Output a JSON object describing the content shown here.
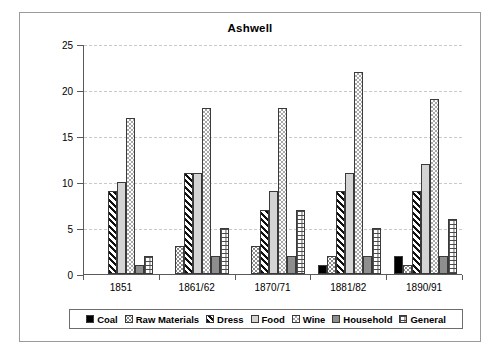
{
  "chart_data": {
    "type": "bar",
    "title": "Ashwell",
    "xlabel": "",
    "ylabel": "No. Principal Providers",
    "ylim": [
      0,
      25
    ],
    "ytick_values": [
      0,
      5,
      10,
      15,
      20,
      25
    ],
    "ytick_labels": [
      "0",
      "5",
      "10",
      "15",
      "20",
      "25"
    ],
    "grid": true,
    "legend_position": "bottom",
    "categories": [
      "1851",
      "1861/62",
      "1870/71",
      "1881/82",
      "1890/91"
    ],
    "series": [
      {
        "name": "Coal",
        "pattern": "solid-black",
        "values": [
          0,
          0,
          0,
          1,
          2
        ]
      },
      {
        "name": "Raw Materials",
        "pattern": "sparse-dots",
        "values": [
          0,
          3,
          3,
          2,
          1
        ]
      },
      {
        "name": "Dress",
        "pattern": "diagonal-stripe",
        "values": [
          9,
          11,
          7,
          9,
          9
        ]
      },
      {
        "name": "Food",
        "pattern": "light-gray",
        "values": [
          10,
          11,
          9,
          11,
          12
        ]
      },
      {
        "name": "Wine",
        "pattern": "checkerboard",
        "values": [
          17,
          18,
          18,
          22,
          19
        ]
      },
      {
        "name": "Household",
        "pattern": "medium-gray",
        "values": [
          1,
          2,
          2,
          2,
          2
        ]
      },
      {
        "name": "General",
        "pattern": "brick-grid",
        "values": [
          2,
          5,
          7,
          5,
          6
        ]
      }
    ]
  },
  "colors": {
    "frame": "#9a9a9a",
    "axis": "#5a5a5a",
    "grid": "#c9c9c9",
    "coal": "#000000",
    "food": "#d4d4d4",
    "household": "#8e8e8e",
    "background": "#ffffff"
  }
}
